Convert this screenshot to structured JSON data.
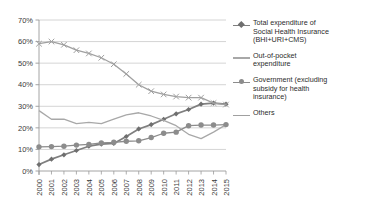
{
  "chart_data": {
    "type": "line",
    "title": "",
    "xlabel": "",
    "ylabel": "",
    "categories": [
      "2000",
      "2001",
      "2002",
      "2003",
      "2004",
      "2005",
      "2006",
      "2007",
      "2008",
      "2009",
      "2010",
      "2011",
      "2012",
      "2013",
      "2014",
      "2015"
    ],
    "ylim": [
      0,
      70
    ],
    "ytick_labels": [
      "0%",
      "10%",
      "20%",
      "30%",
      "40%",
      "50%",
      "60%",
      "70%"
    ],
    "ytick_values": [
      0,
      10,
      20,
      30,
      40,
      50,
      60,
      70
    ],
    "grid": true,
    "legend_position": "right",
    "series": [
      {
        "name": "Total expenditure of Social Health Insurance (BHI+URI+CMS)",
        "legend_label": "Total expenditure of\nSocial Health Insurance\n(BHI+URI+CMS)",
        "marker": "diamond",
        "color": "#7f7f7f",
        "values": [
          3.0,
          5.5,
          7.5,
          9.5,
          11.5,
          12.5,
          12.8,
          16.0,
          19.5,
          21.5,
          24.0,
          26.5,
          28.5,
          31.0,
          31.5,
          31.0
        ]
      },
      {
        "name": "Out-of-pocket expenditure",
        "legend_label": "Out-of-pocket\nexpenditure",
        "marker": "none",
        "color": "#a8a8a8",
        "values": [
          28.0,
          24.0,
          24.0,
          22.0,
          22.5,
          22.0,
          24.0,
          26.0,
          27.0,
          25.5,
          23.5,
          21.0,
          17.0,
          15.0,
          18.0,
          21.5
        ]
      },
      {
        "name": "Government (excluding subsidy for health insurance)",
        "legend_label": "Government (excluding\nsubsidy for health\ninsurance)",
        "marker": "circle",
        "color": "#8c8c8c",
        "values": [
          11.2,
          11.3,
          11.5,
          12.0,
          12.3,
          13.0,
          13.3,
          13.8,
          14.0,
          15.5,
          17.5,
          18.0,
          21.0,
          21.3,
          21.3,
          21.5
        ]
      },
      {
        "name": "Others",
        "legend_label": "Others",
        "marker": "x",
        "color": "#a0a0a0",
        "values": [
          59.0,
          60.0,
          58.5,
          56.0,
          54.5,
          52.5,
          49.5,
          45.0,
          40.0,
          37.0,
          35.5,
          34.5,
          34.0,
          34.0,
          31.5,
          30.8
        ]
      }
    ]
  },
  "axes": {
    "y_suffix": "%"
  }
}
